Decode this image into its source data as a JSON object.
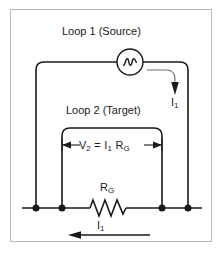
{
  "figure": {
    "type": "circuit-diagram",
    "background_color": "#ffffff",
    "frame_color": "#b9b9bd",
    "line_color": "#1a1a1a"
  },
  "labels": {
    "loop1": "Loop 1 (Source)",
    "loop2": "Loop 2 (Target)",
    "resistor": "R",
    "resistor_sub": "G",
    "current_right": "I",
    "current_right_sub": "1",
    "current_bottom": "I",
    "current_bottom_sub": "1",
    "equation": {
      "v": "V",
      "v_sub": "2",
      "equals": "=",
      "i": "I",
      "i_sub": "1",
      "r": "R",
      "r_sub": "G"
    }
  },
  "components": {
    "ac_source": {
      "name": "ac-voltage-source",
      "symbol": "sine-wave-in-circle",
      "cx": 130,
      "cy": 62,
      "r": 13
    },
    "resistor": {
      "name": "resistor-rg",
      "symbol": "zigzag",
      "x_start": 90,
      "x_end": 126,
      "y": 208
    },
    "nodes": [
      {
        "name": "node-loop1-left",
        "x": 36,
        "y": 208
      },
      {
        "name": "node-loop2-left",
        "x": 62,
        "y": 208
      },
      {
        "name": "node-loop2-right",
        "x": 162,
        "y": 208
      },
      {
        "name": "node-loop1-right",
        "x": 188,
        "y": 208
      }
    ]
  },
  "loops": {
    "loop1": {
      "left": 36,
      "right": 188,
      "top": 62,
      "bottom": 208
    },
    "loop2": {
      "left": 62,
      "right": 162,
      "top": 128,
      "bottom": 208
    }
  },
  "arrows": {
    "current_right": {
      "direction": "down",
      "style": "curved",
      "x": 175,
      "y_from": 70,
      "y_to": 93
    },
    "current_bottom": {
      "direction": "left",
      "style": "straight",
      "y": 235,
      "x_from": 148,
      "x_to": 70
    },
    "dimension": {
      "style": "double-headed",
      "y": 145,
      "x_from": 62,
      "x_to": 162
    }
  }
}
